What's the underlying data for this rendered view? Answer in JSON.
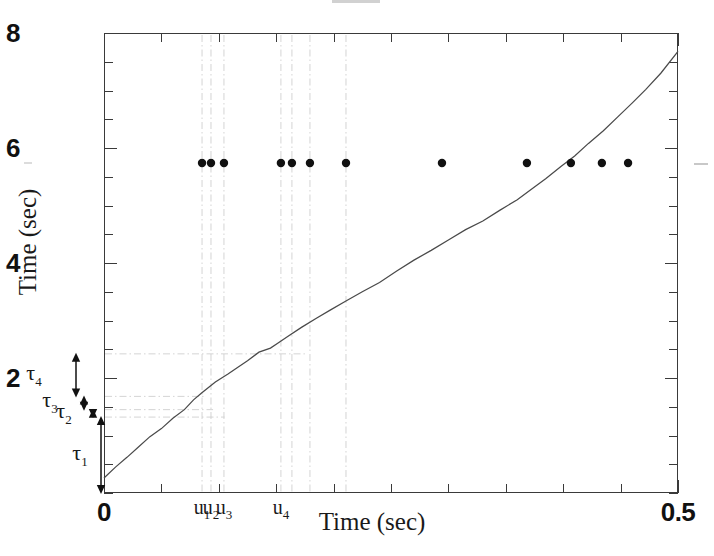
{
  "chart_data": {
    "type": "line",
    "title": "",
    "xlabel": "Time (sec)",
    "ylabel": "Time (sec)",
    "xlim": [
      0,
      0.5
    ],
    "ylim": [
      0,
      8
    ],
    "xticks": [
      0,
      0.5
    ],
    "xtick_labels": [
      "0",
      "0.5"
    ],
    "yticks": [
      2,
      4,
      6,
      8
    ],
    "ytick_labels": [
      "2",
      "4",
      "6",
      "8"
    ],
    "xminor_step": 0.05,
    "yminor_step": 0.5,
    "grid": false,
    "legend": "none",
    "series": [
      {
        "name": "cumulative-time-curve",
        "type": "line",
        "x": [
          0.0,
          0.01,
          0.02,
          0.03,
          0.04,
          0.05,
          0.06,
          0.07,
          0.078,
          0.085,
          0.097,
          0.108,
          0.116,
          0.125,
          0.135,
          0.145,
          0.151,
          0.16,
          0.172,
          0.185,
          0.197,
          0.21,
          0.225,
          0.24,
          0.255,
          0.27,
          0.285,
          0.3,
          0.315,
          0.33,
          0.345,
          0.36,
          0.372,
          0.385,
          0.398,
          0.41,
          0.422,
          0.435,
          0.448,
          0.46,
          0.472,
          0.485,
          0.5
        ],
        "y": [
          0.26,
          0.45,
          0.62,
          0.8,
          0.98,
          1.12,
          1.3,
          1.45,
          1.62,
          1.74,
          1.93,
          2.07,
          2.18,
          2.3,
          2.45,
          2.52,
          2.6,
          2.72,
          2.88,
          3.04,
          3.18,
          3.33,
          3.5,
          3.66,
          3.86,
          4.05,
          4.22,
          4.4,
          4.58,
          4.73,
          4.92,
          5.1,
          5.28,
          5.47,
          5.68,
          5.86,
          6.08,
          6.3,
          6.55,
          6.78,
          7.02,
          7.3,
          7.68
        ]
      },
      {
        "name": "event-dots",
        "type": "scatter",
        "y_level": 5.74,
        "x": [
          0.0854,
          0.0932,
          0.1045,
          0.1541,
          0.1637,
          0.1794,
          0.2108,
          0.2944,
          0.3684,
          0.4067,
          0.4337,
          0.4565
        ]
      }
    ],
    "vertical_markers": {
      "style": "dash-dot",
      "color": "#cfcfcf",
      "x": [
        0.0854,
        0.0932,
        0.1045,
        0.1541,
        0.1637,
        0.1794,
        0.2108
      ]
    },
    "horizontal_markers": {
      "style": "dash-dot",
      "color": "#cfcfcf",
      "y": [
        1.32,
        1.45,
        1.68,
        2.42
      ]
    },
    "annotations": {
      "u_labels": [
        {
          "text": "u",
          "sub": "1",
          "x": 0.0854
        },
        {
          "text": "u",
          "sub": "2",
          "x": 0.0932
        },
        {
          "text": "u",
          "sub": "3",
          "x": 0.1045
        },
        {
          "text": "u",
          "sub": "4",
          "x": 0.1541
        }
      ],
      "tau_labels": [
        {
          "text": "τ",
          "sub": "1",
          "y_from": 0.0,
          "y_to": 1.32,
          "label_y": 0.66
        },
        {
          "text": "τ",
          "sub": "2",
          "y_from": 1.32,
          "y_to": 1.45,
          "label_y": 1.39
        },
        {
          "text": "τ",
          "sub": "3",
          "y_from": 1.45,
          "y_to": 1.68,
          "label_y": 1.58
        },
        {
          "text": "τ",
          "sub": "4",
          "y_from": 1.68,
          "y_to": 2.42,
          "label_y": 2.05
        }
      ]
    },
    "colors": {
      "curve": "#4a4a4a",
      "dots": "#111111",
      "marker_lines": "#cfcfcf",
      "axes": "#3a3a3a",
      "text": "#1a1a1a"
    }
  },
  "axes": {
    "x_title": "Time (sec)",
    "y_title": "Time (sec)",
    "x_tick_labels": [
      "0",
      "0.5"
    ],
    "y_tick_labels": [
      "2",
      "4",
      "6",
      "8"
    ]
  }
}
